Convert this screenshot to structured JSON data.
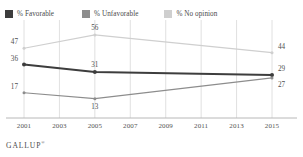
{
  "legend": {
    "items": [
      {
        "label": "% Favorable",
        "color": "#3d3d3d",
        "icon": "square-swatch-icon"
      },
      {
        "label": "% Unfavorable",
        "color": "#8d8d8d",
        "icon": "square-swatch-icon"
      },
      {
        "label": "% No opinion",
        "color": "#cfcfcf",
        "icon": "square-swatch-icon"
      }
    ]
  },
  "footer": {
    "brand": "GALLUP",
    "mark": "®"
  },
  "chart_data": {
    "type": "line",
    "title": "",
    "subtitle": "",
    "xlabel": "",
    "ylabel": "",
    "grid": true,
    "grid_axis": "x",
    "legend_position": "top-left",
    "x": [
      2001,
      2005,
      2015
    ],
    "xticks": [
      "2001",
      "2003",
      "2005",
      "2007",
      "2009",
      "2011",
      "2013",
      "2015"
    ],
    "xlim": [
      2001,
      2015
    ],
    "ylim": [
      0,
      62
    ],
    "series": [
      {
        "name": "% Favorable",
        "color": "#3d3d3d",
        "values": [
          36,
          31,
          29
        ],
        "labels": [
          "36",
          "31",
          "29"
        ]
      },
      {
        "name": "% Unfavorable",
        "color": "#8d8d8d",
        "values": [
          17,
          13,
          27
        ],
        "labels": [
          "17",
          "13",
          "27"
        ]
      },
      {
        "name": "% No opinion",
        "color": "#cfcfcf",
        "values": [
          47,
          56,
          44
        ],
        "labels": [
          "47",
          "56",
          "44"
        ]
      }
    ]
  }
}
